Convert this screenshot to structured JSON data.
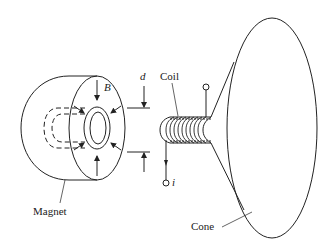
{
  "diagram": {
    "labels": {
      "magnet": "Magnet",
      "coil": "Coil",
      "cone": "Cone",
      "field": "B",
      "gap": "d",
      "current": "i"
    },
    "colors": {
      "stroke": "#222222",
      "background": "#ffffff"
    }
  }
}
